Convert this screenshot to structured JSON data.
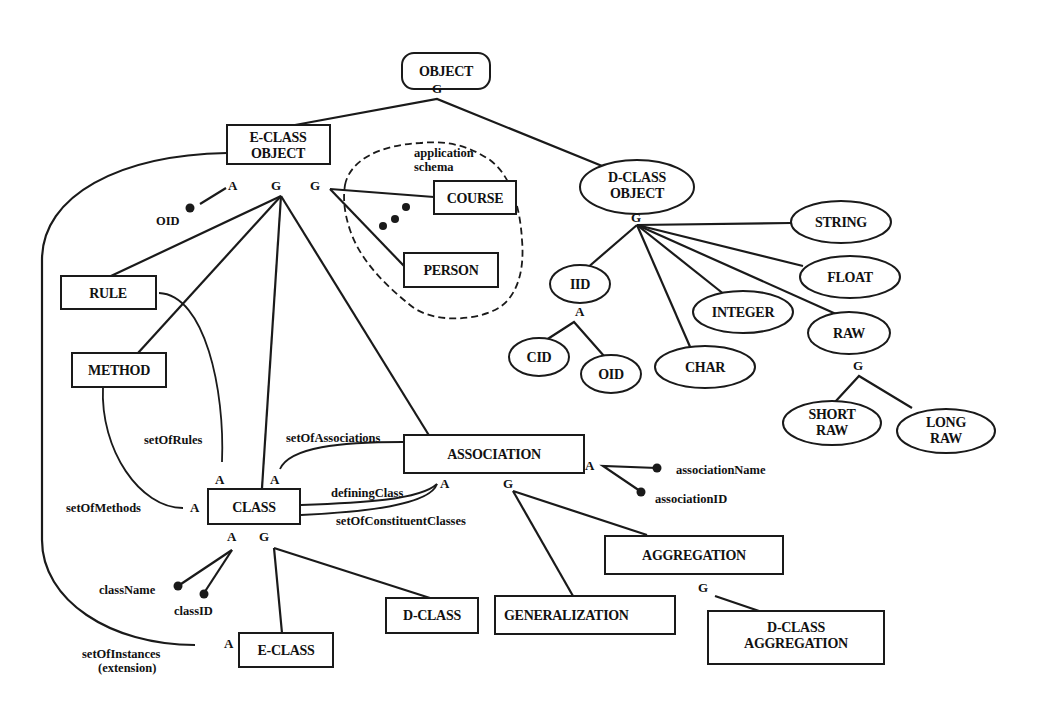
{
  "diagram": {
    "nodes": {
      "object": "OBJECT",
      "eclass_object_1": "E-CLASS",
      "eclass_object_2": "OBJECT",
      "dclass_object_1": "D-CLASS",
      "dclass_object_2": "OBJECT",
      "course": "COURSE",
      "person": "PERSON",
      "rule": "RULE",
      "method": "METHOD",
      "class": "CLASS",
      "association": "ASSOCIATION",
      "aggregation": "AGGREGATION",
      "generalization": "GENERALIZATION",
      "dclass": "D-CLASS",
      "eclass": "E-CLASS",
      "dclass_aggregation_1": "D-CLASS",
      "dclass_aggregation_2": "AGGREGATION",
      "string": "STRING",
      "float": "FLOAT",
      "integer": "INTEGER",
      "raw": "RAW",
      "char": "CHAR",
      "iid": "IID",
      "cid": "CID",
      "oid": "OID",
      "short_raw_1": "SHORT",
      "short_raw_2": "RAW",
      "long_raw_1": "LONG",
      "long_raw_2": "RAW"
    },
    "region": {
      "label_1": "application",
      "label_2": "schema"
    },
    "attributes": {
      "oid": "OID",
      "set_of_rules": "setOfRules",
      "set_of_methods": "setOfMethods",
      "set_of_associations": "setOfAssociations",
      "defining_class": "definingClass",
      "set_of_constituent_classes": "setOfConstituentClasses",
      "association_name": "associationName",
      "association_id": "associationID",
      "class_name": "className",
      "class_id": "classID",
      "set_of_instances_1": "setOfInstances",
      "set_of_instances_2": "(extension)"
    },
    "markers": {
      "generalization": "G",
      "aggregation": "A"
    }
  }
}
